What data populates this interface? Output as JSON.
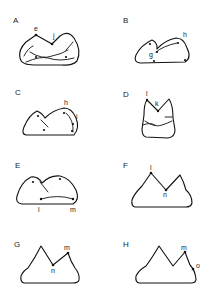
{
  "diagram": {
    "panels": [
      {
        "id": "A",
        "label": "A",
        "points": [
          "e",
          "j"
        ]
      },
      {
        "id": "B",
        "label": "B",
        "points": [
          "h",
          "g"
        ]
      },
      {
        "id": "C",
        "label": "C",
        "points": [
          "h",
          "i"
        ]
      },
      {
        "id": "D",
        "label": "D",
        "points": [
          "l",
          "k"
        ]
      },
      {
        "id": "E",
        "label": "E",
        "points": [
          "l",
          "m"
        ]
      },
      {
        "id": "F",
        "label": "F",
        "points": [
          "l",
          "n"
        ]
      },
      {
        "id": "G",
        "label": "G",
        "points": [
          "m",
          "n"
        ]
      },
      {
        "id": "H",
        "label": "H",
        "points": [
          "m",
          "o"
        ]
      }
    ],
    "colors": {
      "stroke": "#111111",
      "background": "#ffffff"
    }
  }
}
